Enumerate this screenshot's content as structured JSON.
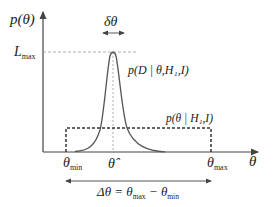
{
  "diagram": {
    "y_axis_label": "p(θ)",
    "x_axis_label": "θ",
    "peak_width_label": "δθ",
    "peak_height_label": {
      "main": "L",
      "sub": "max"
    },
    "likelihood_label": "p(D | θ,H₁,I)",
    "prior_label": "p(θ | H₁,I)",
    "theta_min": {
      "main": "θ",
      "sub": "min"
    },
    "theta_hat": "θ̂",
    "theta_max": {
      "main": "θ",
      "sub": "max"
    },
    "range_label": {
      "lhs": "Δθ = θ",
      "sub1": "max",
      "mid": " − θ",
      "sub2": "min"
    },
    "colors": {
      "curve": "#555555",
      "axes": "#444444",
      "dashes": "#999999",
      "prior_box": "#333333"
    }
  }
}
